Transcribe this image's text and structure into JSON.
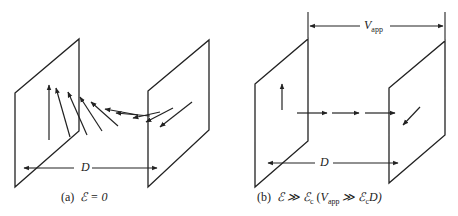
{
  "panels": [
    {
      "id": "a",
      "caption": "(a) ℰ = 0",
      "caption_prefix": "(a)",
      "caption_math": "ℰ = 0",
      "distance_label": "D",
      "description": "Two parallel plates separated by distance D; magnetization arrows rotate gradually from vertical at the left plate to the in-plane/diagonal direction at the right plate (twisted spin configuration)."
    },
    {
      "id": "b",
      "caption": "(b) ℰ ≫ ℰc (Vapp ≫ ℰc D)",
      "caption_prefix": "(b)",
      "caption_math_1": "ℰ ≫ ℰ",
      "caption_sub_c1": "c",
      "caption_open": "(",
      "caption_v": "V",
      "caption_sub_app": "app",
      "caption_math_2": "≫ ℰ",
      "caption_sub_c2": "c",
      "caption_d": "D)",
      "distance_label": "D",
      "voltage_label": "V",
      "voltage_sub": "app",
      "description": "Two parallel plates with applied voltage Vapp; arrows align horizontally along the field between plates, with a vertical arrow at the left plate and a diagonal arrow at the right plate."
    }
  ],
  "colors": {
    "line": "#222222",
    "background": "#ffffff"
  }
}
